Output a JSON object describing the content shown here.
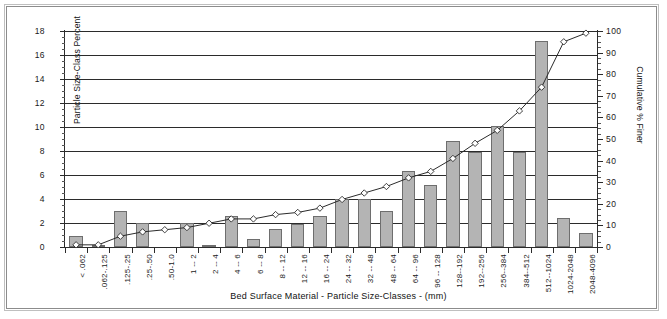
{
  "chart_data": {
    "type": "bar",
    "title": "",
    "xlabel": "Bed Surface Material  -  Particle Size-Classes  -  (mm)",
    "ylabel": "Particle Size-Class Percent",
    "y2label": "Cumulative % Finer",
    "ylim": [
      0,
      18
    ],
    "y2lim": [
      0,
      100
    ],
    "ytick_step": 2,
    "y2tick_step": 10,
    "grid": true,
    "legend": "none",
    "categories": [
      "< .062",
      ".062-.125",
      ".125-.25",
      ".25-.50",
      ".50-1.0",
      "1 -- 2",
      "2 -- 4",
      "4 -- 6",
      "6 -- 8",
      "8 -- 12",
      "12 -- 16",
      "16 -- 24",
      "24 -- 32",
      "32 -- 48",
      "48 -- 64",
      "64 -- 96",
      "96 -- 128",
      "128--192",
      "192--256",
      "256--384",
      "384--512",
      "512--1024",
      "1024-2048",
      "2048-4096"
    ],
    "series": [
      {
        "name": "Particle Size-Class Percent",
        "type": "bar",
        "axis": "left",
        "values": [
          0.9,
          0.1,
          3.0,
          2.0,
          0.0,
          2.0,
          0.1,
          2.6,
          0.7,
          1.5,
          1.9,
          2.6,
          4.0,
          4.0,
          3.0,
          6.3,
          5.2,
          8.8,
          7.9,
          10.1,
          7.9,
          17.2,
          2.4,
          1.2
        ]
      },
      {
        "name": "Cumulative % Finer",
        "type": "line",
        "axis": "right",
        "marker": "open-diamond",
        "values": [
          1,
          1,
          5,
          7,
          8,
          9,
          11,
          13,
          13,
          15,
          16,
          18,
          22,
          25,
          28,
          32,
          35,
          41,
          48,
          54,
          63,
          74,
          95,
          99
        ]
      }
    ],
    "y_ticks_left": [
      "0",
      "2",
      "4",
      "6",
      "8",
      "10",
      "12",
      "14",
      "16",
      "18"
    ],
    "y_ticks_right": [
      "0",
      "10",
      "20",
      "30",
      "40",
      "50",
      "60",
      "70",
      "80",
      "90",
      "100"
    ],
    "colors": {
      "bar_fill": "#b4b4b4",
      "bar_stroke": "#6e6e6e",
      "line": "#2b2b2b",
      "marker_fill": "#ffffff",
      "axis": "#2b2b2b",
      "background": "#ffffff",
      "frame": "#8c8c8c"
    }
  }
}
